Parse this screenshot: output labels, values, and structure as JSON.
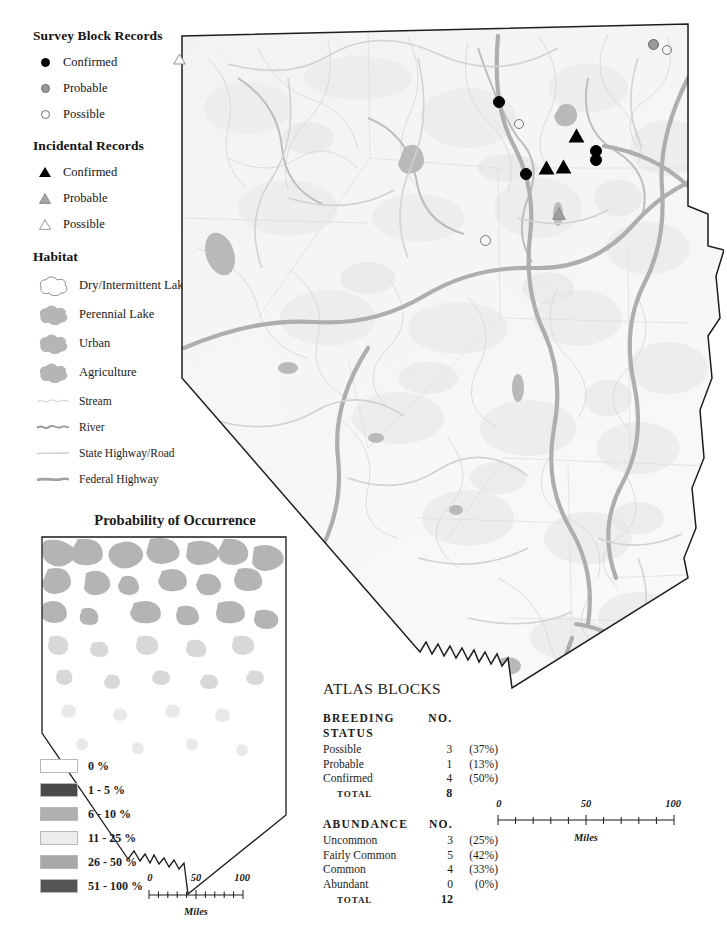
{
  "legend": {
    "survey_block": {
      "title": "Survey Block Records",
      "items": [
        {
          "label": "Confirmed",
          "symbol": "filled-circle-icon"
        },
        {
          "label": "Probable",
          "symbol": "gray-circle-icon"
        },
        {
          "label": "Possible",
          "symbol": "open-circle-icon"
        }
      ]
    },
    "incidental": {
      "title": "Incidental Records",
      "items": [
        {
          "label": "Confirmed",
          "symbol": "filled-triangle-icon"
        },
        {
          "label": "Probable",
          "symbol": "gray-triangle-icon"
        },
        {
          "label": "Possible",
          "symbol": "open-triangle-icon"
        }
      ]
    },
    "habitat": {
      "title": "Habitat",
      "areas": [
        {
          "label": "Dry/Intermittent Lake",
          "color": "#ffffff",
          "stroke": "#8a8a8a"
        },
        {
          "label": "Perennial Lake",
          "color": "#b5b5b5",
          "stroke": "#b5b5b5"
        },
        {
          "label": "Urban",
          "color": "#b5b5b5",
          "stroke": "#b5b5b5"
        },
        {
          "label": "Agriculture",
          "color": "#b5b5b5",
          "stroke": "#b5b5b5"
        }
      ],
      "lines": [
        {
          "label": "Stream",
          "color": "#c9c9c9",
          "width": 1
        },
        {
          "label": "River",
          "color": "#9a9a9a",
          "width": 2
        },
        {
          "label": "State Highway/Road",
          "color": "#cccccc",
          "width": 1.4
        },
        {
          "label": "Federal Highway",
          "color": "#a0a0a0",
          "width": 2.6
        }
      ]
    }
  },
  "probability": {
    "title": "Probability of Occurrence",
    "swatches": [
      {
        "label": "0 %",
        "color": "#ffffff"
      },
      {
        "label": "1 - 5 %",
        "color": "#4a4a4a"
      },
      {
        "label": "6 - 10 %",
        "color": "#b0b0b0"
      },
      {
        "label": "11 - 25 %",
        "color": "#ececec"
      },
      {
        "label": "26 - 50 %",
        "color": "#a8a8a8"
      },
      {
        "label": "51 - 100 %",
        "color": "#555555"
      }
    ]
  },
  "scalebars": {
    "inset": {
      "ticks": [
        "0",
        "50",
        "100"
      ],
      "units": "Miles"
    },
    "main": {
      "ticks": [
        "0",
        "50",
        "100"
      ],
      "units": "Miles"
    }
  },
  "atlas": {
    "title": "ATLAS BLOCKS",
    "sections": [
      {
        "header": "BREEDING STATUS",
        "no_header": "NO.",
        "rows": [
          {
            "label": "Possible",
            "no": "3",
            "pct": "(37%)"
          },
          {
            "label": "Probable",
            "no": "1",
            "pct": "(13%)"
          },
          {
            "label": "Confirmed",
            "no": "4",
            "pct": "(50%)"
          }
        ],
        "total_label": "TOTAL",
        "total_no": "8"
      },
      {
        "header": "ABUNDANCE",
        "no_header": "NO.",
        "rows": [
          {
            "label": "Uncommon",
            "no": "3",
            "pct": "(25%)"
          },
          {
            "label": "Fairly Common",
            "no": "5",
            "pct": "(42%)"
          },
          {
            "label": "Common",
            "no": "4",
            "pct": "(33%)"
          },
          {
            "label": "Abundant",
            "no": "0",
            "pct": "(0%)"
          }
        ],
        "total_label": "TOTAL",
        "total_no": "12"
      }
    ]
  },
  "map_markers": [
    {
      "type": "open-triangle",
      "x": 11,
      "y": 40
    },
    {
      "type": "gray-circle",
      "x": 486,
      "y": 27
    },
    {
      "type": "open-circle",
      "x": 500,
      "y": 33
    },
    {
      "type": "filled-circle",
      "x": 331,
      "y": 84
    },
    {
      "type": "open-circle",
      "x": 351,
      "y": 106
    },
    {
      "type": "filled-triangle",
      "x": 408,
      "y": 117
    },
    {
      "type": "filled-circle",
      "x": 428,
      "y": 133
    },
    {
      "type": "filled-circle",
      "x": 428,
      "y": 142
    },
    {
      "type": "filled-triangle",
      "x": 395,
      "y": 148
    },
    {
      "type": "filled-triangle",
      "x": 378,
      "y": 149
    },
    {
      "type": "filled-circle",
      "x": 358,
      "y": 156
    },
    {
      "type": "gray-triangle",
      "x": 390,
      "y": 194
    },
    {
      "type": "open-circle",
      "x": 317,
      "y": 222
    }
  ]
}
